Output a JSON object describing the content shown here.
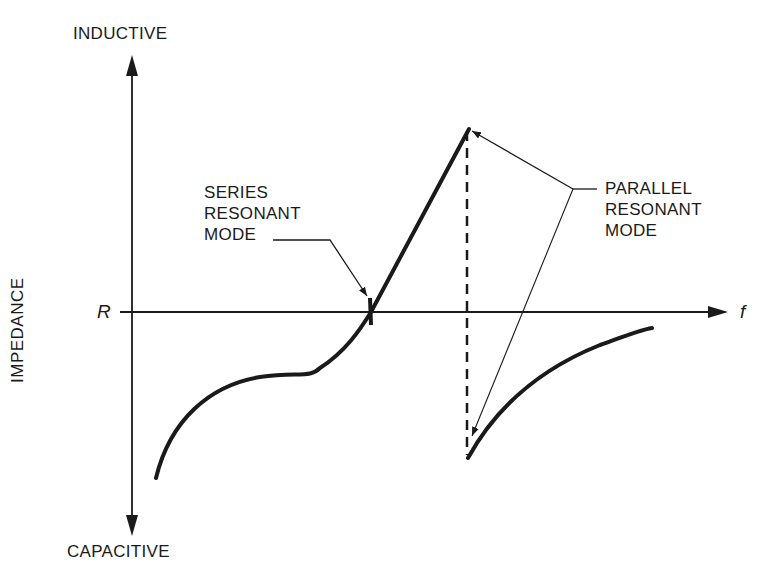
{
  "labels": {
    "y_top": "INDUCTIVE",
    "y_bottom": "CAPACITIVE",
    "y_axis": "IMPEDANCE",
    "x_axis": "f",
    "x_axis_crossing": "R",
    "series_mode": [
      "SERIES",
      "RESONANT",
      "MODE"
    ],
    "parallel_mode": [
      "PARALLEL",
      "RESONANT",
      "MODE"
    ]
  },
  "colors": {
    "ink": "#1a1a1a",
    "background": "#ffffff"
  }
}
